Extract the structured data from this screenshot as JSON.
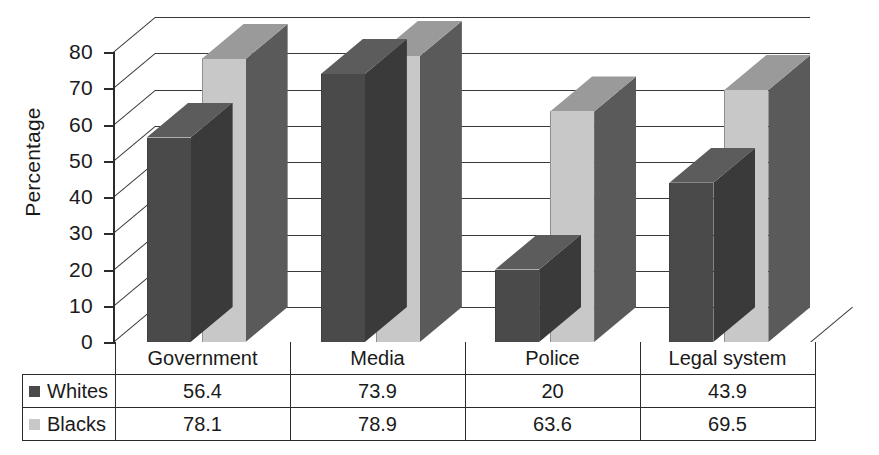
{
  "chart_data": {
    "type": "bar",
    "title": "",
    "xlabel": "",
    "ylabel": "Percentage",
    "ylim": [
      0,
      80
    ],
    "ytick_step": 10,
    "yticks": [
      "80",
      "70",
      "60",
      "50",
      "40",
      "30",
      "20",
      "10",
      "0"
    ],
    "grid": true,
    "legend_position": "table-row-headers",
    "three_d": true,
    "categories": [
      "Government",
      "Media",
      "Police",
      "Legal system"
    ],
    "series": [
      {
        "name": "Whites",
        "color": "#4a4a4a",
        "values": [
          56.4,
          73.9,
          20,
          43.9
        ],
        "labels": [
          "56.4",
          "73.9",
          "20",
          "43.9"
        ]
      },
      {
        "name": "Blacks",
        "color": "#c8c8c8",
        "values": [
          78.1,
          78.9,
          63.6,
          69.5
        ],
        "labels": [
          "78.1",
          "78.9",
          "63.6",
          "69.5"
        ]
      }
    ]
  },
  "table": {
    "corner_label": "",
    "column_headers": [
      "Government",
      "Media",
      "Police",
      "Legal system"
    ],
    "rows": [
      {
        "legend": "Whites",
        "swatch": "#4a4a4a",
        "cells": [
          "56.4",
          "73.9",
          "20",
          "43.9"
        ]
      },
      {
        "legend": "Blacks",
        "swatch": "#c8c8c8",
        "cells": [
          "78.1",
          "78.9",
          "63.6",
          "69.5"
        ]
      }
    ]
  },
  "palette": {
    "series_dark": "#4a4a4a",
    "series_dark_side": "#3a3a3a",
    "series_dark_top": "#5c5c5c",
    "series_light": "#c8c8c8",
    "series_light_side": "#5a5a5a",
    "series_light_top": "#9a9a9a",
    "axis": "#2b2b2b",
    "grid": "#3a3a3a",
    "background": "#ffffff"
  }
}
